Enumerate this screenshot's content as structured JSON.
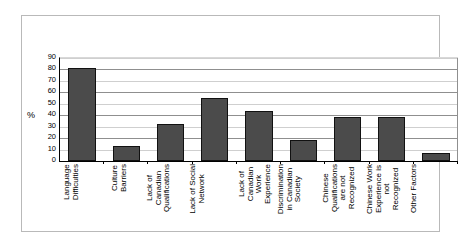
{
  "chart_data": {
    "type": "bar",
    "title": "",
    "subtitle": "",
    "xlabel": "",
    "ylabel": "%",
    "ylim": [
      0,
      90
    ],
    "ytick_step": 10,
    "yticks": [
      90,
      80,
      70,
      60,
      50,
      40,
      30,
      20,
      10,
      0
    ],
    "grid": true,
    "legend": false,
    "categories": [
      "Language Difficulties",
      "Culture Barriers",
      "Lack of Canadian Qualifications",
      "Lack of Social Network",
      "Lack of Canadian Work Experience",
      "Discrimination in Canadian Society",
      "Chinese Qualifications are not Recognized",
      "Chinese Work Experience is not Recognized",
      "Other Factors"
    ],
    "category_lines": [
      [
        "Language",
        "Difficulties"
      ],
      [
        "Culture",
        "Barriers"
      ],
      [
        "Lack of",
        "Canadian",
        "Qualifications"
      ],
      [
        "Lack of Social",
        "Network"
      ],
      [
        "Lack of",
        "Canadian",
        "Work",
        "Experience"
      ],
      [
        "Discrimination",
        "in Canadian",
        "Society"
      ],
      [
        "Chinese",
        "Qualifications",
        "are not",
        "Recognized"
      ],
      [
        "Chinese Work",
        "Experience is",
        "not",
        "Recognized"
      ],
      [
        "Other Factors"
      ]
    ],
    "values": [
      81,
      13.5,
      32,
      55,
      43.5,
      18,
      38.5,
      38.5,
      7
    ],
    "bar_color": "#4b4b4b",
    "bar_border_color": "#111111",
    "gridline_color": "#cfcfcf",
    "axis_color": "#000000"
  }
}
